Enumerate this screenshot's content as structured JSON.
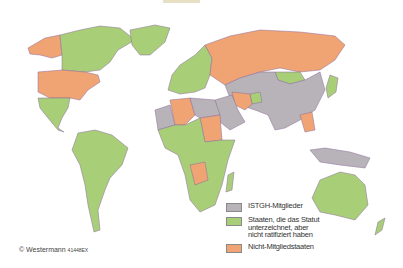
{
  "map": {
    "title": "ISTGH membership world map",
    "colors": {
      "member": "#b8b3b8",
      "signed": "#a8cf78",
      "nonmember": "#f0a474",
      "coast": "#6d8fc0"
    }
  },
  "legend": {
    "items": [
      {
        "label": "ISTGH-Mitglieder",
        "color": "#b8b3b8"
      },
      {
        "label": "Staaten, die das Statut\nunterzeichnet, aber\nnicht ratifiziert haben",
        "color": "#a8cf78"
      },
      {
        "label": "Nicht-Mitgliedstaaten",
        "color": "#f0a474"
      }
    ]
  },
  "credit": {
    "text": "© Westermann",
    "code": "41448EX"
  }
}
